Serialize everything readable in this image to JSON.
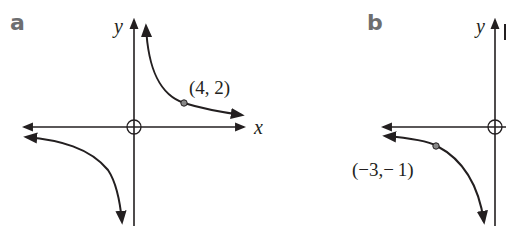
{
  "panels": [
    {
      "label": "a",
      "axes": {
        "x_label": "x",
        "y_label": "y"
      },
      "point": {
        "label": "(4, 2)",
        "x": 4,
        "y": 2
      },
      "curve": "hyperbola y = 8/x, branches in quadrants I and III"
    },
    {
      "label": "b",
      "axes": {
        "x_label": "x",
        "y_label": "y"
      },
      "point": {
        "label": "(−3,− 1)",
        "x": -3,
        "y": -1
      },
      "curve": "hyperbola y = 3/x, branch in quadrant III (partially cropped)"
    }
  ],
  "colors": {
    "line": "#231f20",
    "label": "#6d6e70",
    "point": "#888888"
  }
}
